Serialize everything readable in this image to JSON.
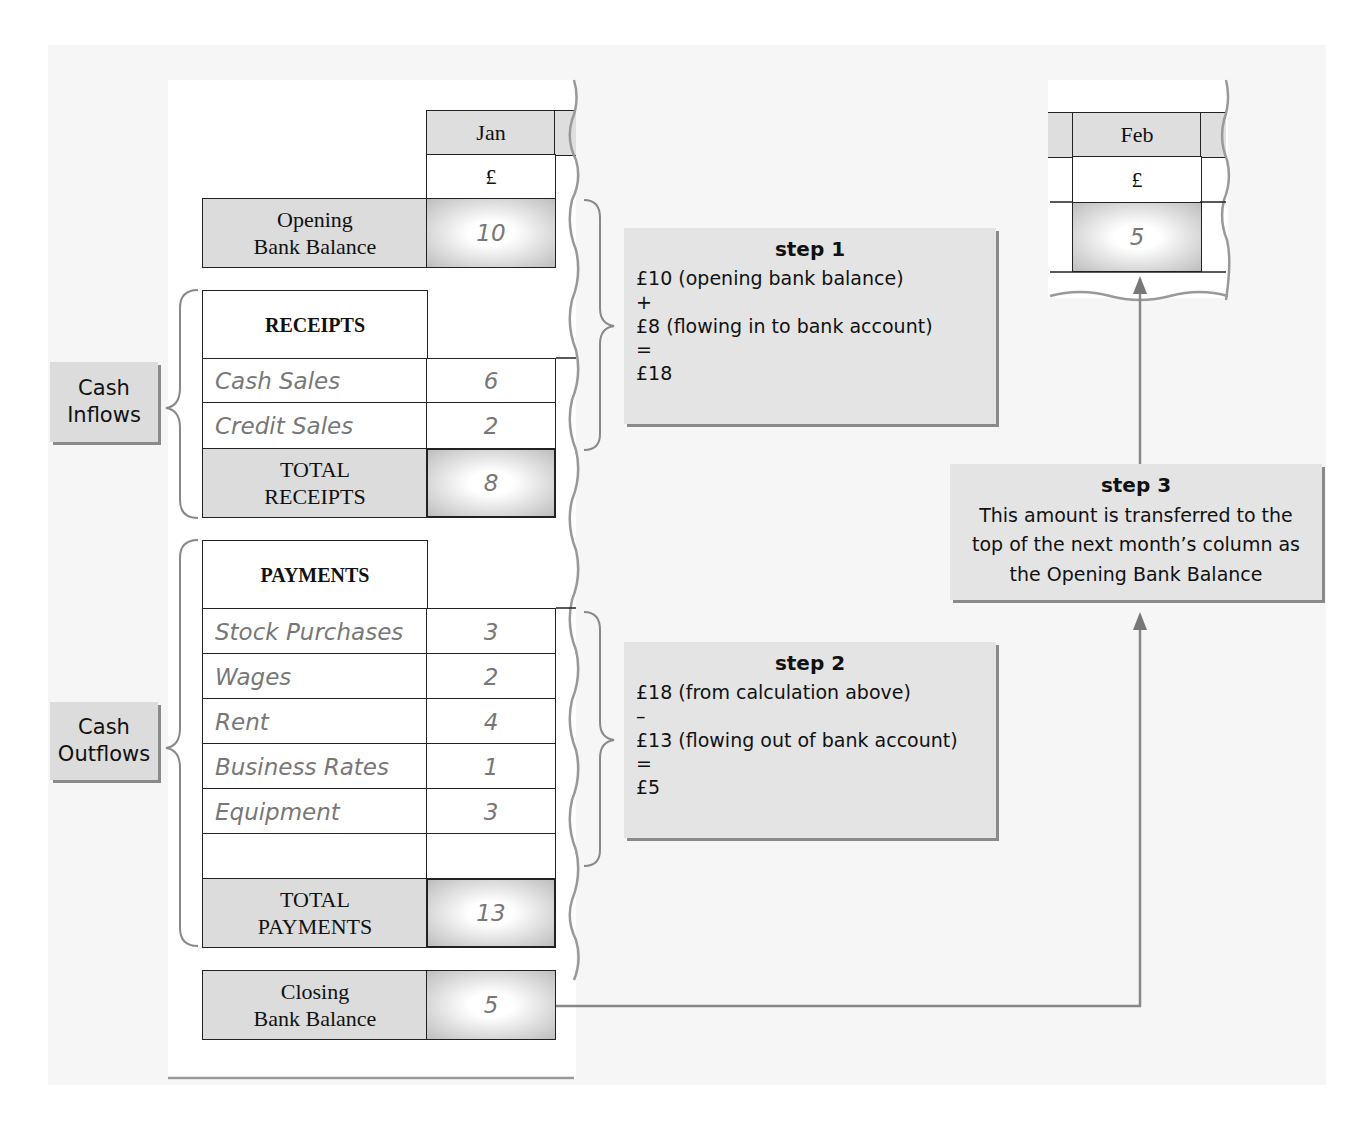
{
  "diagram": {
    "jan_column": {
      "month": "Jan",
      "currency": "£",
      "opening_bank_balance": {
        "label": "Opening Bank Balance",
        "label_line1": "Opening",
        "label_line2": "Bank Balance",
        "value": "10"
      },
      "receipts": {
        "header": "RECEIPTS",
        "items": [
          {
            "label": "Cash Sales",
            "value": "6"
          },
          {
            "label": "Credit Sales",
            "value": "2"
          }
        ],
        "total_label_line1": "TOTAL",
        "total_label_line2": "RECEIPTS",
        "total_value": "8"
      },
      "payments": {
        "header": "PAYMENTS",
        "items": [
          {
            "label": "Stock Purchases",
            "value": "3"
          },
          {
            "label": "Wages",
            "value": "2"
          },
          {
            "label": "Rent",
            "value": "4"
          },
          {
            "label": "Business Rates",
            "value": "1"
          },
          {
            "label": "Equipment",
            "value": "3"
          },
          {
            "label": "",
            "value": ""
          }
        ],
        "total_label_line1": "TOTAL",
        "total_label_line2": "PAYMENTS",
        "total_value": "13"
      },
      "closing_bank_balance": {
        "label_line1": "Closing",
        "label_line2": "Bank Balance",
        "value": "5"
      }
    },
    "feb_column": {
      "month": "Feb",
      "currency": "£",
      "opening_value": "5"
    },
    "side_labels": {
      "inflows_line1": "Cash",
      "inflows_line2": "Inflows",
      "outflows_line1": "Cash",
      "outflows_line2": "Outflows"
    },
    "steps": {
      "step1": {
        "title": "step 1",
        "lines": [
          "£10 (opening bank balance)",
          "+",
          "£8 (flowing in to bank account)",
          "=",
          "£18"
        ]
      },
      "step2": {
        "title": "step 2",
        "lines": [
          "£18 (from calculation above)",
          "–",
          "£13 (flowing out of bank account)",
          "=",
          "£5"
        ]
      },
      "step3": {
        "title": "step 3",
        "lines": [
          "This amount is transferred to the",
          "top of the next month’s column as",
          "the Opening Bank Balance"
        ]
      }
    },
    "colors": {
      "panel_grey": "#dcdcdc",
      "background": "#f6f6f6",
      "value_text": "#777777",
      "connector": "#888888"
    }
  }
}
